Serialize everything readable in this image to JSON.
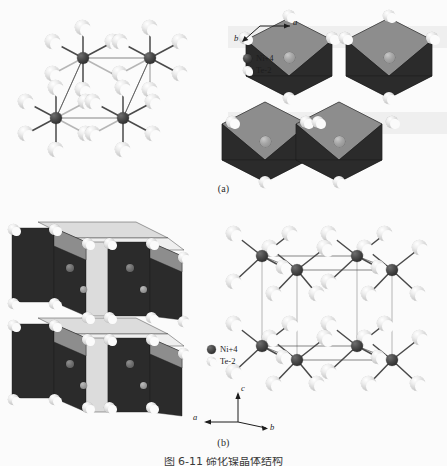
{
  "figure": {
    "background_color": "#fbfbfb",
    "panels": [
      {
        "id": "a",
        "caption": "(a)"
      },
      {
        "id": "b",
        "caption": "(b)"
      }
    ],
    "bottom_caption": "图 6-11  碲化镍晶体结构"
  },
  "legend_top": {
    "items": [
      {
        "marker": "ni-sphere-icon",
        "label": "Ni+4",
        "color": "#4a4a4a"
      },
      {
        "marker": "te-sphere-icon",
        "label": "Te-2",
        "color": "#d5d5d5"
      }
    ]
  },
  "legend_bottom": {
    "items": [
      {
        "marker": "ni-sphere-icon",
        "label": "Ni+4",
        "color": "#4a4a4a"
      },
      {
        "marker": "te-sphere-icon",
        "label": "Te-2",
        "color": "#d5d5d5"
      }
    ]
  },
  "axes_top": {
    "labels": {
      "a": "a",
      "b": "b"
    }
  },
  "axes_bottom": {
    "labels": {
      "a": "a",
      "b": "b",
      "c": "c"
    }
  },
  "colors": {
    "ni_atom": "#4a4a4a",
    "te_atom": "#d5d5d5",
    "polyhedron_dark_face": "#2b2b2b",
    "polyhedron_mid_face": "#8d8d8d",
    "polyhedron_light_face": "#dcdcdc",
    "bond_dark": "#4a4a4a",
    "bond_light": "#b6b6b6",
    "cell_edge": "#555555"
  },
  "structure_data": {
    "type": "crystal-structure-diagram",
    "compound": "NiTe2",
    "coordination": "octahedral",
    "ni_per_cell_panel_a": 4,
    "te_per_ni": 6,
    "octahedra_panel_a": 4,
    "layers_panel_b": 2,
    "octahedra_per_layer_panel_b": 4,
    "ni_columns_panel_b_right": 4,
    "views": [
      {
        "panel": "a",
        "left": "ball-and-stick, view along c",
        "right": "polyhedral, edge-sharing octahedra, view along c"
      },
      {
        "panel": "b",
        "left": "polyhedral layers, side view",
        "right": "ball-and-stick unit cell, side view"
      }
    ]
  }
}
